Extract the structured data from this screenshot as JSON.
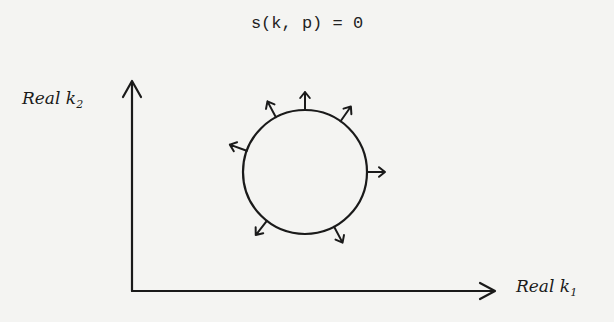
{
  "equation": "s(k, p) = 0",
  "axes": {
    "y_label": "Real k",
    "y_subscript": "2",
    "x_label": "Real k",
    "x_subscript": "1"
  },
  "figure": {
    "circle": {
      "cx": 305,
      "cy": 172,
      "r": 62
    },
    "outward_arrow_angles_deg": [
      90,
      55,
      0,
      -62,
      -128,
      160,
      118
    ],
    "stroke_color": "#1a1a1a",
    "background": "#f4f4f2"
  }
}
